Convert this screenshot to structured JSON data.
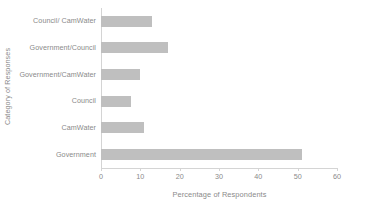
{
  "chart_data": {
    "type": "bar",
    "orientation": "horizontal",
    "title": "",
    "xlabel": "Percentage of Respondents",
    "ylabel": "Category of Responses",
    "categories": [
      "Government",
      "CamWater",
      "Council",
      "Government/CamWater",
      "Government/Council",
      "Council/ CamWater"
    ],
    "values": [
      51,
      11,
      7.5,
      10,
      17,
      13
    ],
    "xlim": [
      0,
      60
    ],
    "xticks": [
      0,
      10,
      20,
      30,
      40,
      50,
      60
    ],
    "xtick_labels": [
      "0",
      "10",
      "20",
      "30",
      "40",
      "50",
      "60"
    ],
    "grid": false,
    "legend": null,
    "bar_color": "#bfbfbf",
    "axis_color": "#d4d4d4",
    "text_color": "#8a8a8a"
  }
}
